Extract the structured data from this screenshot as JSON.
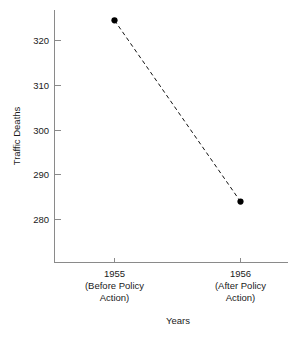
{
  "chart_data": {
    "type": "line",
    "title": "",
    "subtitle": "",
    "xlabel": "Years",
    "ylabel": "Traffic Deaths",
    "categories": [
      "1955\n(Before Policy\nAction)",
      "1956\n(After Policy\nAction)"
    ],
    "category_lines": [
      [
        "1955",
        "(Before Policy",
        "Action)"
      ],
      [
        "1956",
        "(After Policy",
        "Action)"
      ]
    ],
    "x": [
      1955,
      1956
    ],
    "values": [
      324.5,
      284
    ],
    "series": [
      {
        "name": "Traffic Deaths",
        "values": [
          324.5,
          284
        ],
        "line_style": "dashed",
        "marker": "filled-circle",
        "color": "#000000"
      }
    ],
    "ylim": [
      272,
      327
    ],
    "yticks": [
      280,
      290,
      300,
      310,
      320
    ],
    "ytick_labels": [
      "280",
      "290",
      "300",
      "310",
      "320"
    ],
    "xticks": [
      1955,
      1956
    ],
    "grid": false,
    "legend": false,
    "legend_position": "none",
    "annotations": []
  },
  "axes": {
    "y_axis_label": "Traffic Deaths",
    "x_axis_label": "Years",
    "y_tick_0": "280",
    "y_tick_1": "290",
    "y_tick_2": "300",
    "y_tick_3": "310",
    "y_tick_4": "320",
    "x_cat_0_line_0": "1955",
    "x_cat_0_line_1": "(Before Policy",
    "x_cat_0_line_2": "Action)",
    "x_cat_1_line_0": "1956",
    "x_cat_1_line_1": "(After Policy",
    "x_cat_1_line_2": "Action)"
  },
  "style": {
    "background": "#ffffff",
    "axis_color": "#8a8a8a",
    "text_color": "#1a1a1a",
    "series_color": "#000000"
  }
}
